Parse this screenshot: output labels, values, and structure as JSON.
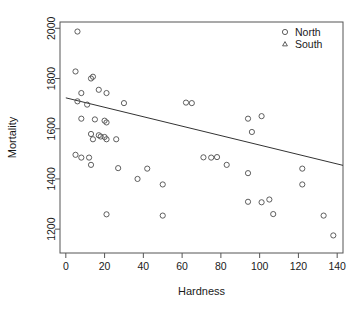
{
  "chart_data": {
    "type": "scatter",
    "title": "",
    "xlabel": "Hardness",
    "ylabel": "Mortality",
    "xlim": [
      -3,
      143
    ],
    "ylim": [
      1105,
      2025
    ],
    "grid": false,
    "xticks": [
      0,
      20,
      40,
      60,
      80,
      100,
      120,
      140
    ],
    "yticks": [
      1200,
      1400,
      1600,
      1800,
      2000
    ],
    "xtick_labels": [
      "0",
      "20",
      "40",
      "60",
      "80",
      "100",
      "120",
      "140"
    ],
    "ytick_labels": [
      "1200",
      "1400",
      "1600",
      "1800",
      "2000"
    ],
    "legend": {
      "position": "top-right",
      "entries": [
        {
          "name": "North",
          "marker": "circle"
        },
        {
          "name": "South",
          "marker": "triangle"
        }
      ]
    },
    "series": [
      {
        "name": "North",
        "marker": "circle",
        "color": "#4d4d4d",
        "points": [
          [
            6,
            1987
          ],
          [
            5,
            1828
          ],
          [
            13,
            1800
          ],
          [
            14,
            1807
          ],
          [
            8,
            1742
          ],
          [
            17,
            1755
          ],
          [
            21,
            1742
          ],
          [
            6,
            1709
          ],
          [
            11,
            1696
          ],
          [
            30,
            1702
          ],
          [
            62,
            1704
          ],
          [
            65,
            1702
          ],
          [
            8,
            1640
          ],
          [
            15,
            1637
          ],
          [
            20,
            1632
          ],
          [
            21,
            1625
          ],
          [
            94,
            1640
          ],
          [
            101,
            1650
          ],
          [
            13,
            1579
          ],
          [
            14,
            1558
          ],
          [
            17,
            1574
          ],
          [
            18,
            1569
          ],
          [
            20,
            1567
          ],
          [
            21,
            1558
          ],
          [
            26,
            1558
          ],
          [
            96,
            1587
          ],
          [
            5,
            1496
          ],
          [
            8,
            1485
          ],
          [
            12,
            1485
          ],
          [
            13,
            1456
          ],
          [
            27,
            1443
          ],
          [
            37,
            1400
          ],
          [
            42,
            1441
          ],
          [
            71,
            1486
          ],
          [
            75,
            1485
          ],
          [
            78,
            1487
          ],
          [
            83,
            1456
          ],
          [
            94,
            1423
          ],
          [
            122,
            1441
          ],
          [
            50,
            1378
          ],
          [
            21,
            1259
          ],
          [
            50,
            1254
          ],
          [
            94,
            1309
          ],
          [
            101,
            1307
          ],
          [
            105,
            1318
          ],
          [
            107,
            1260
          ],
          [
            122,
            1378
          ],
          [
            133,
            1254
          ],
          [
            138,
            1175
          ]
        ]
      },
      {
        "name": "South",
        "marker": "triangle",
        "color": "#4d4d4d",
        "points": []
      }
    ],
    "fit_line": {
      "name": "regression-line",
      "color": "#333333",
      "x": [
        0,
        143
      ],
      "y": [
        1723,
        1454
      ]
    }
  }
}
